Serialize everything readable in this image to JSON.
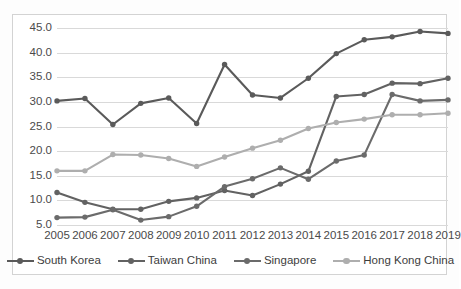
{
  "chart_data": {
    "type": "line",
    "title": "",
    "xlabel": "",
    "ylabel": "",
    "categories": [
      "2005",
      "2006",
      "2007",
      "2008",
      "2009",
      "2010",
      "2011",
      "2012",
      "2013",
      "2014",
      "2015",
      "2016",
      "2017",
      "2018",
      "2019"
    ],
    "ylim": [
      5.0,
      45.0
    ],
    "yticks": [
      "5.0",
      "10.0",
      "15.0",
      "20.0",
      "25.0",
      "30.0",
      "35.0",
      "40.0",
      "45.0"
    ],
    "ytick_values": [
      5.0,
      10.0,
      15.0,
      20.0,
      25.0,
      30.0,
      35.0,
      40.0,
      45.0
    ],
    "grid": true,
    "legend_position": "bottom",
    "series": [
      {
        "name": "South Korea",
        "color": "#5a5a5a",
        "values": [
          30.2,
          30.7,
          25.4,
          29.7,
          30.8,
          25.6,
          37.6,
          31.4,
          30.8,
          34.8,
          39.8,
          42.6,
          43.2,
          44.3,
          43.9
        ]
      },
      {
        "name": "Taiwan China",
        "color": "#626262",
        "values": [
          11.6,
          9.6,
          8.2,
          8.2,
          9.8,
          10.5,
          12.0,
          11.0,
          13.3,
          15.9,
          31.1,
          31.5,
          33.8,
          33.7,
          34.8
        ]
      },
      {
        "name": "Singapore",
        "color": "#6b6b6b",
        "values": [
          6.5,
          6.6,
          8.1,
          6.0,
          6.7,
          8.8,
          12.8,
          14.4,
          16.6,
          14.3,
          18.0,
          19.2,
          31.5,
          30.2,
          30.4
        ]
      },
      {
        "name": "Hong Kong China",
        "color": "#aeaeae",
        "values": [
          16.0,
          16.0,
          19.3,
          19.2,
          18.5,
          16.9,
          18.8,
          20.6,
          22.2,
          24.6,
          25.8,
          26.5,
          27.4,
          27.4,
          27.7
        ]
      }
    ]
  },
  "legend": {
    "items": [
      {
        "label": "South Korea"
      },
      {
        "label": "Taiwan China"
      },
      {
        "label": "Singapore"
      },
      {
        "label": "Hong Kong China"
      }
    ]
  }
}
